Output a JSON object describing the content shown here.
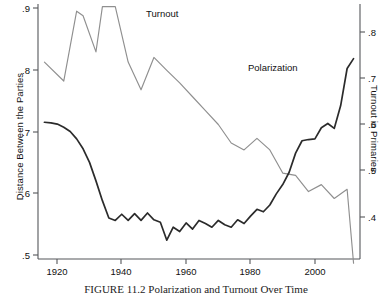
{
  "caption": "FIGURE 11.2 Polarization and Turnout Over Time",
  "axes": {
    "left_title": "Distance Between the Parties",
    "right_title": "Turnout in Primaries",
    "left_ticks": [
      ".9",
      ".8",
      ".7",
      ".6",
      ".5"
    ],
    "right_ticks": [
      ".8",
      ".7",
      ".6",
      ".5",
      ".4"
    ],
    "x_ticks": [
      "1920",
      "1940",
      "1960",
      "1980",
      "2000"
    ]
  },
  "labels": {
    "turnout": "Turnout",
    "polarization": "Polarization"
  },
  "colors": {
    "polarization": "#2b2b2b",
    "turnout": "#8f8f8f",
    "axis": "#55575a"
  },
  "chart_data": {
    "type": "line",
    "title": "FIGURE 11.2 Polarization and Turnout Over Time",
    "xlabel": "",
    "ylabel": "Distance Between the Parties",
    "y2label": "Turnout in Primaries",
    "xlim": [
      1914,
      2014
    ],
    "ylim": [
      0.5,
      0.9
    ],
    "y2lim": [
      0.355,
      0.855
    ],
    "xticks": [
      1920,
      1940,
      1960,
      1980,
      2000
    ],
    "yticks": [
      0.5,
      0.6,
      0.7,
      0.8,
      0.9
    ],
    "y2ticks": [
      0.4,
      0.5,
      0.6,
      0.7,
      0.8
    ],
    "grid": false,
    "legend": "inline-annotations",
    "series": [
      {
        "name": "Polarization",
        "axis": "left",
        "color": "#2b2b2b",
        "x": [
          1916,
          1918,
          1920,
          1922,
          1924,
          1926,
          1928,
          1930,
          1932,
          1934,
          1936,
          1938,
          1940,
          1942,
          1944,
          1946,
          1948,
          1950,
          1952,
          1954,
          1956,
          1958,
          1960,
          1962,
          1964,
          1966,
          1968,
          1970,
          1972,
          1974,
          1976,
          1978,
          1980,
          1982,
          1984,
          1986,
          1988,
          1990,
          1992,
          1994,
          1996,
          1998,
          2000,
          2002,
          2004,
          2006,
          2008,
          2010,
          2012
        ],
        "values": [
          0.715,
          0.714,
          0.712,
          0.707,
          0.7,
          0.688,
          0.672,
          0.65,
          0.62,
          0.588,
          0.56,
          0.556,
          0.566,
          0.556,
          0.567,
          0.556,
          0.568,
          0.557,
          0.553,
          0.524,
          0.545,
          0.538,
          0.552,
          0.542,
          0.556,
          0.551,
          0.545,
          0.556,
          0.549,
          0.545,
          0.557,
          0.551,
          0.563,
          0.574,
          0.57,
          0.581,
          0.599,
          0.614,
          0.634,
          0.665,
          0.685,
          0.687,
          0.688,
          0.706,
          0.713,
          0.705,
          0.742,
          0.802,
          0.818
        ]
      },
      {
        "name": "Turnout",
        "axis": "right",
        "color": "#8f8f8f",
        "x": [
          1916,
          1922,
          1926,
          1928,
          1932,
          1934,
          1938,
          1942,
          1946,
          1950,
          1954,
          1958,
          1962,
          1966,
          1970,
          1974,
          1978,
          1982,
          1986,
          1990,
          1994,
          1998,
          2002,
          2006,
          2010,
          2012
        ],
        "values": [
          0.735,
          0.694,
          0.845,
          0.835,
          0.757,
          0.855,
          0.855,
          0.735,
          0.675,
          0.745,
          0.717,
          0.69,
          0.66,
          0.63,
          0.6,
          0.56,
          0.545,
          0.57,
          0.545,
          0.495,
          0.49,
          0.455,
          0.47,
          0.44,
          0.46,
          0.3
        ]
      }
    ]
  }
}
